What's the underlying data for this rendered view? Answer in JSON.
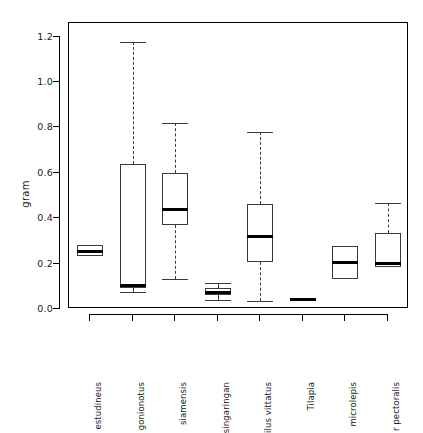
{
  "chart_data": {
    "type": "boxplot",
    "title": "",
    "xlabel": "",
    "ylabel": "gram",
    "ylim": [
      0.0,
      1.26
    ],
    "yticks": [
      0.0,
      0.2,
      0.4,
      0.6,
      0.8,
      1.0,
      1.2
    ],
    "ytick_labels": [
      "0.0",
      "0.2",
      "0.4",
      "0.6",
      "0.8",
      "1.0",
      "1.2"
    ],
    "grid": false,
    "legend": null,
    "categories": [
      "estudineus",
      "gonionotus",
      "\u0001 siamensis",
      "singaringan",
      "ilus vittatus",
      "Tilapia",
      " microlepis",
      "r pectoralis"
    ],
    "boxes": [
      {
        "category": "estudineus",
        "whisker_low": 0.235,
        "q1": 0.235,
        "median": 0.255,
        "q3": 0.283,
        "whisker_high": 0.283,
        "has_whiskers": false
      },
      {
        "category": "gonionotus",
        "whisker_low": 0.073,
        "q1": 0.094,
        "median": 0.105,
        "q3": 0.639,
        "whisker_high": 1.175,
        "has_whiskers": true
      },
      {
        "category": "\u0001 siamensis",
        "whisker_low": 0.131,
        "q1": 0.368,
        "median": 0.44,
        "q3": 0.601,
        "whisker_high": 0.818,
        "has_whiskers": true
      },
      {
        "category": "singaringan",
        "whisker_low": 0.039,
        "q1": 0.06,
        "median": 0.074,
        "q3": 0.094,
        "whisker_high": 0.116,
        "has_whiskers": true
      },
      {
        "category": "ilus vittatus",
        "whisker_low": 0.035,
        "q1": 0.208,
        "median": 0.32,
        "q3": 0.464,
        "whisker_high": 0.779,
        "has_whiskers": true
      },
      {
        "category": "Tilapia",
        "whisker_low": 0.04,
        "q1": 0.04,
        "median": 0.04,
        "q3": 0.04,
        "whisker_high": 0.04,
        "has_whiskers": false
      },
      {
        "category": " microlepis",
        "whisker_low": 0.13,
        "q1": 0.13,
        "median": 0.205,
        "q3": 0.278,
        "whisker_high": 0.278,
        "has_whiskers": false
      },
      {
        "category": "r pectoralis",
        "whisker_low": 0.183,
        "q1": 0.185,
        "median": 0.201,
        "q3": 0.336,
        "whisker_high": 0.465,
        "has_whiskers": true
      }
    ]
  },
  "colors": {
    "axis": "#000000",
    "box_outline": "#3a3a3a",
    "median": "#000000",
    "background": "#ffffff"
  }
}
